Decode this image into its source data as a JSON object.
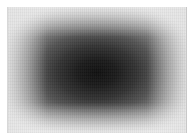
{
  "image": {
    "description": "Grayscale vignette gradient: dark center fading to light gray edges",
    "colors": {
      "center": "#101010",
      "mid": "#555555",
      "edge": "#e2e2e2",
      "background": "#ffffff",
      "border": "#c8c8c8"
    }
  }
}
